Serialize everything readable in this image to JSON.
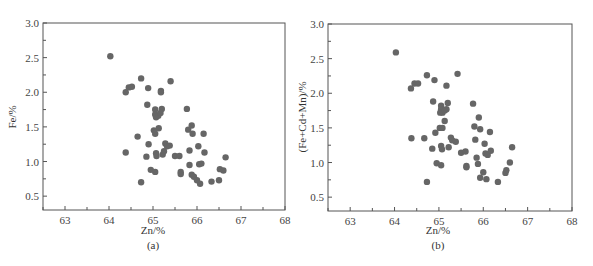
{
  "chart_data": [
    {
      "id": "a",
      "type": "scatter",
      "title": "",
      "panel_label": "(a)",
      "xlabel": "Zn/%",
      "ylabel": "Fe/%",
      "xlim": [
        62.5,
        68
      ],
      "ylim": [
        0.3,
        3.0
      ],
      "xticks": [
        63,
        64,
        65,
        66,
        67,
        68
      ],
      "yticks": [
        0.5,
        1.0,
        1.5,
        2.0,
        2.5,
        3.0
      ],
      "ytick_labels": [
        "0.5",
        "1.0",
        "1.5",
        "2.0",
        "2.5",
        "3.0"
      ],
      "grid": false,
      "marker_color": "#666666",
      "points": [
        [
          64.03,
          2.52
        ],
        [
          64.38,
          2.0
        ],
        [
          64.45,
          2.07
        ],
        [
          64.52,
          2.08
        ],
        [
          64.73,
          2.2
        ],
        [
          64.89,
          2.06
        ],
        [
          65.18,
          2.02
        ],
        [
          65.18,
          2.0
        ],
        [
          65.4,
          2.16
        ],
        [
          64.87,
          1.82
        ],
        [
          65.05,
          1.75
        ],
        [
          65.2,
          1.76
        ],
        [
          65.05,
          1.68
        ],
        [
          65.07,
          1.64
        ],
        [
          65.12,
          1.66
        ],
        [
          65.17,
          1.7
        ],
        [
          65.77,
          1.76
        ],
        [
          65.02,
          1.45
        ],
        [
          65.05,
          1.4
        ],
        [
          65.13,
          1.48
        ],
        [
          64.65,
          1.36
        ],
        [
          64.9,
          1.25
        ],
        [
          64.38,
          1.13
        ],
        [
          65.07,
          1.12
        ],
        [
          65.08,
          1.08
        ],
        [
          65.22,
          1.1
        ],
        [
          65.25,
          1.15
        ],
        [
          65.28,
          1.26
        ],
        [
          65.32,
          1.22
        ],
        [
          65.38,
          1.23
        ],
        [
          65.5,
          1.08
        ],
        [
          65.6,
          1.08
        ],
        [
          64.85,
          1.07
        ],
        [
          64.95,
          0.88
        ],
        [
          65.05,
          0.85
        ],
        [
          64.73,
          0.7
        ],
        [
          65.63,
          0.85
        ],
        [
          65.63,
          0.82
        ],
        [
          65.8,
          1.46
        ],
        [
          65.88,
          1.52
        ],
        [
          65.9,
          1.4
        ],
        [
          65.83,
          1.16
        ],
        [
          66.15,
          1.4
        ],
        [
          66.03,
          1.22
        ],
        [
          66.17,
          1.13
        ],
        [
          65.83,
          0.95
        ],
        [
          65.88,
          0.81
        ],
        [
          65.93,
          0.78
        ],
        [
          66.0,
          0.73
        ],
        [
          66.07,
          0.68
        ],
        [
          66.05,
          0.96
        ],
        [
          66.1,
          0.97
        ],
        [
          66.33,
          0.71
        ],
        [
          66.5,
          0.73
        ],
        [
          66.52,
          0.89
        ],
        [
          66.6,
          0.87
        ],
        [
          66.65,
          1.06
        ]
      ]
    },
    {
      "id": "b",
      "type": "scatter",
      "title": "",
      "panel_label": "(b)",
      "xlabel": "Zn/%",
      "ylabel": "(Fe+Cd+Mn)/%",
      "xlim": [
        62.5,
        68
      ],
      "ylim": [
        0.3,
        3.0
      ],
      "xticks": [
        63,
        64,
        65,
        66,
        67,
        68
      ],
      "yticks": [
        0.5,
        1.0,
        1.5,
        2.0,
        2.5,
        3.0
      ],
      "ytick_labels": [
        "0.5",
        "1.0",
        "1.5",
        "2.0",
        "2.5",
        "3.0"
      ],
      "grid": false,
      "marker_color": "#666666",
      "points": [
        [
          64.03,
          2.59
        ],
        [
          64.37,
          2.07
        ],
        [
          64.45,
          2.14
        ],
        [
          64.53,
          2.14
        ],
        [
          64.73,
          2.26
        ],
        [
          64.9,
          2.19
        ],
        [
          65.17,
          2.11
        ],
        [
          65.42,
          2.28
        ],
        [
          64.87,
          1.88
        ],
        [
          65.05,
          1.82
        ],
        [
          65.05,
          1.77
        ],
        [
          65.03,
          1.72
        ],
        [
          65.08,
          1.72
        ],
        [
          65.13,
          1.75
        ],
        [
          65.17,
          1.77
        ],
        [
          65.2,
          1.86
        ],
        [
          65.77,
          1.85
        ],
        [
          65.13,
          1.6
        ],
        [
          65.02,
          1.5
        ],
        [
          65.08,
          1.5
        ],
        [
          64.92,
          1.43
        ],
        [
          64.38,
          1.35
        ],
        [
          64.67,
          1.35
        ],
        [
          65.27,
          1.36
        ],
        [
          65.3,
          1.32
        ],
        [
          65.38,
          1.3
        ],
        [
          65.05,
          1.24
        ],
        [
          65.07,
          1.19
        ],
        [
          65.22,
          1.22
        ],
        [
          64.85,
          1.2
        ],
        [
          65.5,
          1.14
        ],
        [
          65.6,
          1.16
        ],
        [
          64.95,
          0.99
        ],
        [
          65.05,
          0.96
        ],
        [
          65.62,
          0.95
        ],
        [
          65.62,
          0.93
        ],
        [
          64.73,
          0.72
        ],
        [
          65.8,
          1.52
        ],
        [
          65.9,
          1.65
        ],
        [
          65.93,
          1.48
        ],
        [
          66.15,
          1.44
        ],
        [
          65.82,
          1.33
        ],
        [
          66.03,
          1.27
        ],
        [
          65.85,
          1.07
        ],
        [
          66.05,
          1.13
        ],
        [
          66.1,
          1.11
        ],
        [
          66.17,
          1.17
        ],
        [
          65.88,
          0.98
        ],
        [
          66.0,
          0.86
        ],
        [
          65.93,
          0.78
        ],
        [
          66.07,
          0.76
        ],
        [
          66.33,
          0.72
        ],
        [
          66.5,
          0.85
        ],
        [
          66.52,
          0.89
        ],
        [
          66.6,
          1.0
        ],
        [
          66.65,
          1.22
        ]
      ]
    }
  ]
}
